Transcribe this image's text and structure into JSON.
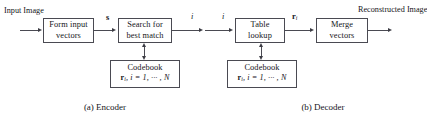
{
  "figure": {
    "background": "#ffffff",
    "line_color": "#4a4a52",
    "text_color": "#15151a"
  },
  "encoder": {
    "caption": "(a)  Encoder",
    "input_label_line1": "Input",
    "input_label_line2": "Image",
    "block1_line1": "Form input",
    "block1_line2": "vectors",
    "block2_line1": "Search for",
    "block2_line2": "best match",
    "codebook_title": "Codebook",
    "codebook_formula_vec": "r",
    "codebook_formula_sub": "i",
    "codebook_formula_rest": ", i = 1, ··· , N",
    "signal_label": "s",
    "index_label": "i"
  },
  "decoder": {
    "caption": "(b)  Decoder",
    "index_label": "i",
    "block1_line1": "Table",
    "block1_line2": "lookup",
    "block2_line1": "Merge",
    "block2_line2": "vectors",
    "codebook_title": "Codebook",
    "codebook_formula_vec": "r",
    "codebook_formula_sub": "i",
    "codebook_formula_rest": ", i = 1, ··· , N",
    "codeword_label_vec": "r",
    "codeword_label_sub": "i",
    "output_label_line1": "Reconstructed",
    "output_label_line2": "Image"
  }
}
